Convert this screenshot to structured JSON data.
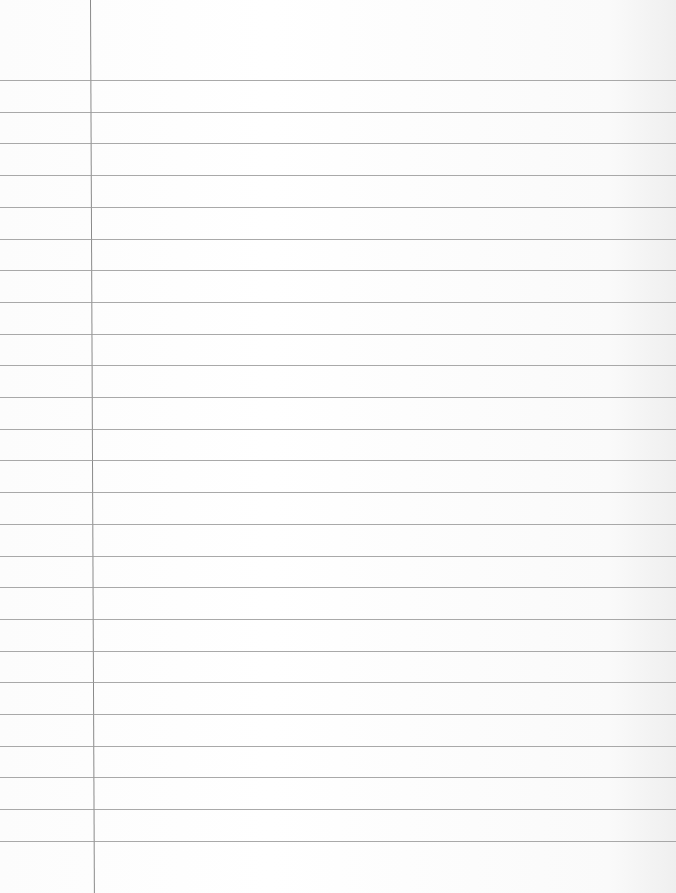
{
  "paper": {
    "type": "lined-notebook-paper",
    "content": "",
    "margin_line_x": 91,
    "rule_count": 25,
    "first_rule_y": 80,
    "rule_spacing": 31.7,
    "colors": {
      "background": "#fdfdfd",
      "rule": "#9a9a9a",
      "margin": "#8a8a8a"
    }
  }
}
